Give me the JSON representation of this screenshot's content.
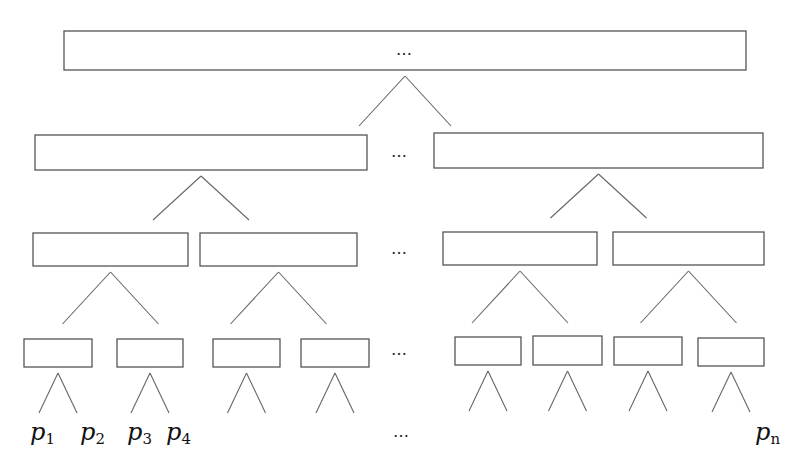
{
  "diagram": {
    "type": "tree",
    "ellipsis": "…",
    "levels": [
      {
        "boxes": [
          [
            64,
            31,
            682,
            39
          ]
        ],
        "ellipsis_in_box": true
      },
      {
        "boxes": [
          [
            35,
            135,
            332,
            35
          ],
          [
            434,
            133,
            329,
            35
          ]
        ],
        "ellipsis": [
          400,
          157
        ]
      },
      {
        "boxes": [
          [
            33,
            233,
            155,
            33
          ],
          [
            200,
            233,
            157,
            33
          ],
          [
            443,
            232,
            154,
            33
          ],
          [
            613,
            232,
            151,
            33
          ]
        ],
        "ellipsis": [
          400,
          254
        ]
      },
      {
        "boxes": [
          [
            24,
            339,
            68,
            28
          ],
          [
            117,
            339,
            66,
            28
          ],
          [
            213,
            339,
            67,
            28
          ],
          [
            301,
            339,
            68,
            28
          ],
          [
            455,
            337,
            66,
            28
          ],
          [
            533,
            336,
            69,
            29
          ],
          [
            614,
            337,
            68,
            28
          ],
          [
            698,
            338,
            66,
            28
          ]
        ],
        "ellipsis": [
          400,
          355
        ]
      }
    ],
    "leaf_labels": [
      {
        "base": "p",
        "sub": "1",
        "x": 30,
        "y": 440
      },
      {
        "base": "p",
        "sub": "2",
        "x": 80,
        "y": 440
      },
      {
        "base": "p",
        "sub": "3",
        "x": 127,
        "y": 440
      },
      {
        "base": "p",
        "sub": "4",
        "x": 166,
        "y": 440
      },
      {
        "base": "p",
        "sub": "n",
        "x": 755,
        "y": 440
      }
    ],
    "leaf_ellipsis": [
      402,
      437
    ]
  }
}
